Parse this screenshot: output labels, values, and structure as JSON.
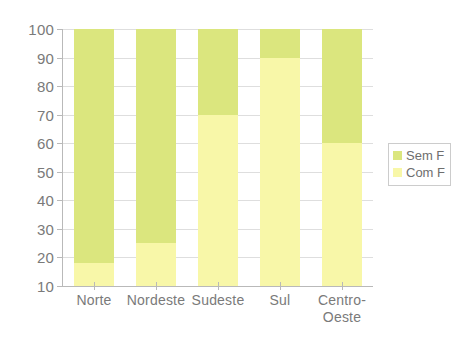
{
  "chart_data": {
    "type": "bar",
    "stacked": true,
    "title": "",
    "xlabel": "",
    "ylabel": "",
    "categories": [
      "Norte",
      "Nordeste",
      "Sudeste",
      "Sul",
      "Centro-Oeste"
    ],
    "category_label_lines": [
      [
        "Norte"
      ],
      [
        "Nordeste"
      ],
      [
        "Sudeste"
      ],
      [
        "Sul"
      ],
      [
        "Centro-",
        "Oeste"
      ]
    ],
    "series": [
      {
        "name": "Sem F",
        "color": "#dbe67e",
        "values": [
          82,
          75,
          30,
          10,
          40
        ]
      },
      {
        "name": "Com F",
        "color": "#f8f7a8",
        "values": [
          18,
          25,
          70,
          90,
          60
        ]
      }
    ],
    "boundaries": [
      18,
      25,
      70,
      90,
      60
    ],
    "ylim": [
      10,
      100
    ],
    "yticks": [
      100,
      90,
      80,
      70,
      60,
      50,
      40,
      30,
      20,
      10
    ],
    "ytick_labels": [
      "100",
      "90",
      "80",
      "70",
      "60",
      "50",
      "40",
      "30",
      "20",
      "10"
    ],
    "grid": true,
    "legend_position": "right",
    "legend": [
      {
        "label": "Sem F",
        "color": "#dbe67e"
      },
      {
        "label": "Com F",
        "color": "#f8f7a8"
      }
    ],
    "axis_color": "#b9b9b9",
    "grid_color": "#dedede",
    "text_color": "#7a7a7a",
    "background": "#ffffff"
  }
}
